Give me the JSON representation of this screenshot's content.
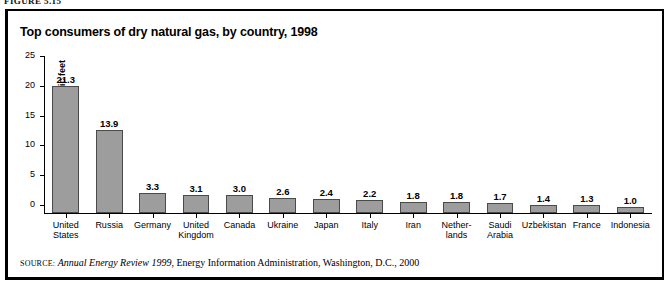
{
  "figure_caption": "FIGURE 5.15",
  "source": {
    "label": "SOURCE:",
    "italic_part": "Annual Energy Review 1999",
    "rest": ", Energy Information Administration, Washington, D.C., 2000"
  },
  "colors": {
    "bar_fill": "#9d9d9d",
    "bar_border": "#4a4a4a",
    "axis": "#000000",
    "background": "#ffffff"
  },
  "chart_data": {
    "type": "bar",
    "title": "Top consumers of dry natural gas, by country, 1998",
    "xlabel": "",
    "ylabel": "Trillion cubic feet",
    "ylim": [
      0,
      25
    ],
    "yticks": [
      0,
      5,
      10,
      15,
      20,
      25
    ],
    "ytick_labels": [
      "0",
      "5",
      "10",
      "15",
      "20",
      "25"
    ],
    "grid": false,
    "legend": null,
    "categories": [
      "United States",
      "Russia",
      "Germany",
      "United Kingdom",
      "Canada",
      "Ukraine",
      "Japan",
      "Italy",
      "Iran",
      "Netherlands",
      "Saudi Arabia",
      "Uzbekistan",
      "France",
      "Indonesia"
    ],
    "category_label_lines": [
      [
        "United",
        "States"
      ],
      [
        "Russia"
      ],
      [
        "Germany"
      ],
      [
        "United",
        "Kingdom"
      ],
      [
        "Canada"
      ],
      [
        "Ukraine"
      ],
      [
        "Japan"
      ],
      [
        "Italy"
      ],
      [
        "Iran"
      ],
      [
        "Nether-",
        "lands"
      ],
      [
        "Saudi",
        "Arabia"
      ],
      [
        "Uzbekistan"
      ],
      [
        "France"
      ],
      [
        "Indonesia"
      ]
    ],
    "values": [
      21.3,
      13.9,
      3.3,
      3.1,
      3.0,
      2.6,
      2.4,
      2.2,
      1.8,
      1.8,
      1.7,
      1.4,
      1.3,
      1.0
    ],
    "value_labels": [
      "21.3",
      "13.9",
      "3.3",
      "3.1",
      "3.0",
      "2.6",
      "2.4",
      "2.2",
      "1.8",
      "1.8",
      "1.7",
      "1.4",
      "1.3",
      "1.0"
    ]
  }
}
